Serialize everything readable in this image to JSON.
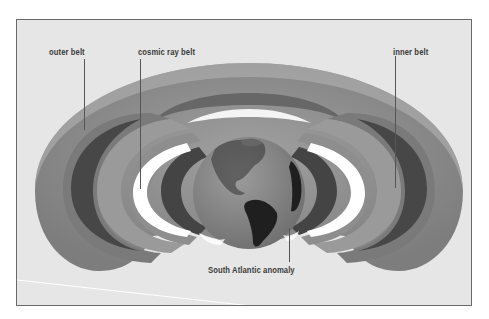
{
  "figure": {
    "labels": {
      "outer_belt": "outer belt",
      "cosmic_ray_belt": "cosmic ray belt",
      "inner_belt": "inner belt",
      "south_atlantic_anomaly": "South Atlantic anomaly"
    },
    "colors": {
      "background": "#e6e6e6",
      "outer_belt": "#8f8f8f",
      "inner_belt": "#a3a3a3",
      "cosmic_ray_belt": "#ffffff",
      "globe_ocean": "#8a8a8a",
      "globe_land": "#2a2a2a",
      "frame_border": "#6a6a6a"
    }
  }
}
